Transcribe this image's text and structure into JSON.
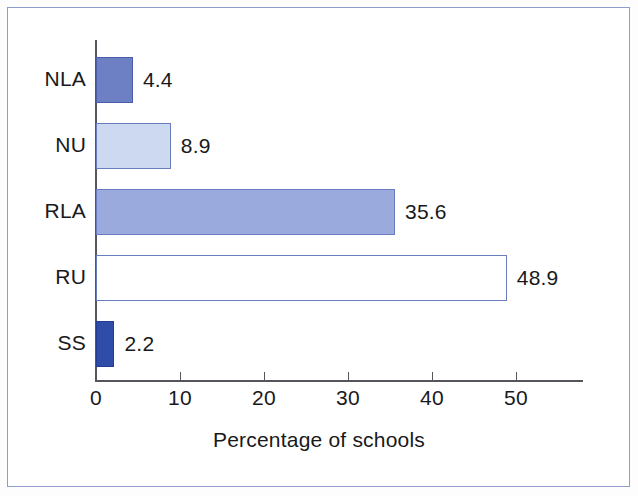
{
  "figure": {
    "frame_color": "#8f9ccd",
    "background": "#ffffff",
    "axis_color": "#55565c",
    "text_color": "#19191b"
  },
  "chart_data": {
    "type": "bar",
    "orientation": "horizontal",
    "title": "",
    "subtitle": "",
    "xlabel": "Percentage of schools",
    "ylabel": "",
    "categories": [
      "NLA",
      "NU",
      "RLA",
      "RU",
      "SS"
    ],
    "values": [
      4.4,
      8.9,
      35.6,
      48.9,
      2.2
    ],
    "value_labels": [
      "4.4",
      "8.9",
      "35.6",
      "48.9",
      "2.2"
    ],
    "xlim": [
      0,
      58
    ],
    "xticks": [
      0,
      10,
      20,
      30,
      40,
      50
    ],
    "xtick_labels": [
      "0",
      "10",
      "20",
      "30",
      "40",
      "50"
    ],
    "grid": false,
    "legend": "none",
    "bar_styles": [
      {
        "category": "NLA",
        "fill": "#6e80c4",
        "stroke": "#4a5da8"
      },
      {
        "category": "NU",
        "fill": "#ccd9f0",
        "stroke": "#6a7cc0"
      },
      {
        "category": "RLA",
        "fill": "#9aaadc",
        "stroke": "#6a7cc0"
      },
      {
        "category": "RU",
        "fill": "#ffffff",
        "stroke": "#6a7cc0"
      },
      {
        "category": "SS",
        "fill": "#2e4ca8",
        "stroke": "#243d92"
      }
    ]
  },
  "axis": {
    "x_title": "Percentage of schools"
  }
}
